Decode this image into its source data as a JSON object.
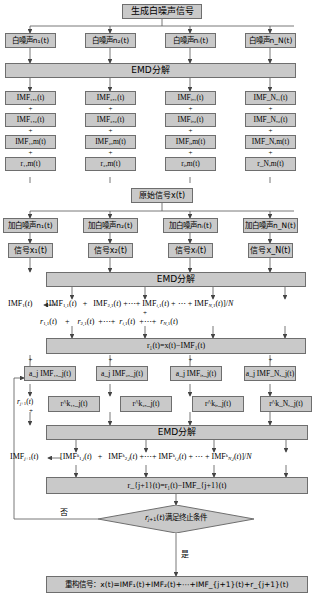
{
  "diagram": {
    "colors": {
      "box_fill": "#c9c9c9",
      "box_border": "#6e6e6e",
      "line": "#555555",
      "text": "#000000"
    },
    "nodes": {
      "gen_noise": "生成白噪声信号",
      "noise_1": "白噪声n₁(t)",
      "noise_2": "白噪声n₂(t)",
      "noise_i": "白噪声nᵢ(t)",
      "noise_N": "白噪声n_N(t)",
      "emd_1": "EMD分解",
      "imf_1_1": "IMF₁,₁(t)",
      "imf_2_1": "IMF₂,₁(t)",
      "imf_i_1": "IMFᵢ,₁(t)",
      "imf_N_1": "IMF_N,₁(t)",
      "imf_1_2": "IMF₁,₂(t)",
      "imf_2_2": "IMF₂,₂(t)",
      "imf_i_2": "IMFᵢ,₂(t)",
      "imf_N_2": "IMF_N,₂(t)",
      "imf_1_m": "IMF₁,m(t)",
      "imf_2_m": "IMF₂,m(t)",
      "imf_i_m": "IMFᵢ,m(t)",
      "imf_N_m": "IMF_N,m(t)",
      "r_1_m": "r₁,m(t)",
      "r_2_m": "r₂,m(t)",
      "r_i_m": "rᵢ,m(t)",
      "r_N_m": "r_N,m(t)",
      "orig_signal": "原始信号x(t)",
      "add_noise_1": "加白噪声n₁(t)",
      "add_noise_2": "加白噪声n₂(t)",
      "add_noise_i": "加白噪声nᵢ(t)",
      "add_noise_N": "加白噪声n_N(t)",
      "signal_1": "信号x₁(t)",
      "signal_2": "信号x₂(t)",
      "signal_i": "信号xᵢ(t)",
      "signal_N": "信号x_N(t)",
      "emd_2": "EMD分解",
      "eq_imf1_lhs": "IMF₁(t)",
      "eq_imf1_rhs": "[IMF₁,₁(t) + IMF₂,₁(t)+⋯+ IMFᵢ,₁(t) + ⋯ + IMF_N,₁(t)]/N",
      "eq_r_row": "r₁,₁(t) + r₂,₁(t) +⋯+ rᵢ,₁(t) +⋯+ r_N,₁(t)",
      "r1_eq": "r₁(t)=x(t)−IMF₁(t)",
      "a_imf_1": "a_j IMF₁,_j(t)",
      "a_imf_2": "a_j IMF₂,_j(t)",
      "a_imf_i": "a_j IMFᵢ,_j(t)",
      "a_imf_N": "a_j IMF_N,_j(t)",
      "rk_1": "r^k₁,_j(t)",
      "rk_2": "r^k₂,_j(t)",
      "rk_i": "r^kᵢ,_j(t)",
      "rk_N": "r^k_N,_j(t)",
      "emd_3": "EMD分解",
      "eq_imfj1_lhs": "IMF_{j+1}(t)",
      "eq_imfj1_rhs": "[IMF^k₁,_j(t) + IMF^k₂,_j(t)+⋯+ IMF^kᵢ,_j(t) + ⋯ + IMF^k_N,_j(t)]/N",
      "rj1_eq": "r_{j+1}(t)=r₁(t)−IMF_{j+1}(t)",
      "decision": "r_{j+1}(t)满足终止条件",
      "label_no": "否",
      "label_yes": "是",
      "feedback_label": "r_{j+1}(t)",
      "reconstruct": "重构信号：x(t)=IMF₁(t)+IMF₂(t)+⋯+IMF_{j+1}(t)+r_{j+1}(t)",
      "plus_sign": "+"
    }
  }
}
